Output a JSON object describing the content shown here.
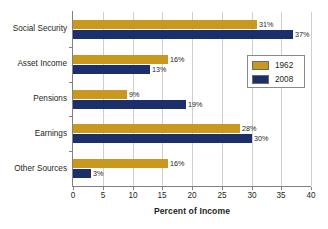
{
  "chart_data": {
    "type": "bar",
    "orientation": "horizontal",
    "title": "",
    "xlabel": "Percent of Income",
    "ylabel": "",
    "xlim": [
      0,
      40
    ],
    "xticks": [
      0,
      5,
      10,
      15,
      20,
      25,
      30,
      35,
      40
    ],
    "xtick_labels": [
      "0",
      "5",
      "10",
      "15",
      "20",
      "25",
      "30",
      "35",
      "40"
    ],
    "grid": true,
    "grid_axis": "x",
    "legend_position": "upper right",
    "categories": [
      "Social Security",
      "Asset Income",
      "Pensions",
      "Earnings",
      "Other Sources"
    ],
    "series": [
      {
        "name": "1962",
        "color": "#c9991f",
        "values": [
          31,
          16,
          9,
          28,
          16
        ],
        "value_labels": [
          "31%",
          "16%",
          "9%",
          "28%",
          "16%"
        ]
      },
      {
        "name": "2008",
        "color": "#1b2f6b",
        "values": [
          37,
          13,
          19,
          30,
          3
        ],
        "value_labels": [
          "37%",
          "13%",
          "19%",
          "30%",
          "3%"
        ]
      }
    ]
  },
  "legend": {
    "entries": [
      {
        "label": "1962",
        "color": "#c9991f"
      },
      {
        "label": "2008",
        "color": "#1b2f6b"
      }
    ]
  },
  "axes": {
    "x_title": "Percent of Income"
  }
}
